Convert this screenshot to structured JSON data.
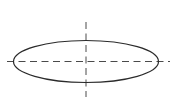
{
  "canvas": {
    "width": 173,
    "height": 110,
    "background_color": "#ffffff",
    "title": "Ellipse with centerlines"
  },
  "drawing": {
    "type": "technical-line-drawing",
    "description": "Horizontally elongated ellipse with horizontal and vertical dashed centerlines crossing at its center",
    "shapes": [
      {
        "name": "ellipse-outline",
        "kind": "ellipse",
        "cx": 86,
        "cy": 61.5,
        "rx": 72.5,
        "ry": 21,
        "stroke_color": "#2b2b2b",
        "stroke_width": 1.2,
        "fill": "none",
        "dash": "none"
      },
      {
        "name": "horizontal-centerline",
        "kind": "line",
        "x1": 7,
        "y1": 61.5,
        "x2": 170,
        "y2": 61.5,
        "stroke_color": "#4a4a4a",
        "stroke_width": 1,
        "dash": "7 4.5"
      },
      {
        "name": "vertical-centerline",
        "kind": "line",
        "x1": 86,
        "y1": 22,
        "x2": 86,
        "y2": 97,
        "stroke_color": "#4a4a4a",
        "stroke_width": 1,
        "dash": "7 4.5"
      }
    ],
    "center_point": {
      "x": 86,
      "y": 61.5
    }
  }
}
